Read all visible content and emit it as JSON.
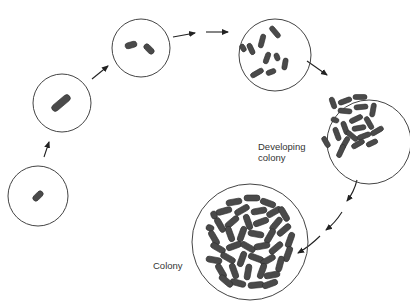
{
  "colors": {
    "stroke": "#444444",
    "cell": "#4a4a4a",
    "cell_edge": "#2e2e2e",
    "text": "#333333"
  },
  "labels": {
    "developing_line1": "Developing",
    "developing_line2": "colony",
    "colony": "Colony"
  },
  "stages": [
    {
      "name": "single-cell",
      "cx": 38,
      "cy": 196,
      "r": 30,
      "cells": 1
    },
    {
      "name": "elongated-cell",
      "cx": 62,
      "cy": 103,
      "r": 29,
      "cells": 1
    },
    {
      "name": "divided-cells",
      "cx": 141,
      "cy": 48,
      "r": 29,
      "cells": 2
    },
    {
      "name": "multiplying-cells",
      "cx": 275,
      "cy": 55,
      "r": 36,
      "cells": 9
    },
    {
      "name": "developing-colony",
      "cx": 369,
      "cy": 142,
      "r": 42,
      "cells": 20
    },
    {
      "name": "colony",
      "cx": 250,
      "cy": 242,
      "r": 58,
      "cells": 60
    }
  ]
}
